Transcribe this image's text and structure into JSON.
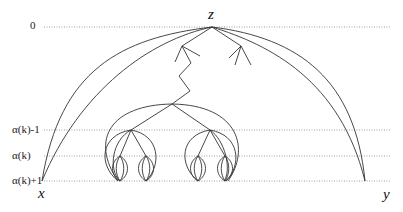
{
  "diagram": {
    "levels": [
      {
        "label": "0",
        "y": 27
      },
      {
        "label": "α(k)-1",
        "y": 130
      },
      {
        "label": "α(k)",
        "y": 156
      },
      {
        "label": "α(k)+1",
        "y": 181
      }
    ],
    "nodes": {
      "z": "z",
      "x": "x",
      "y": "y"
    },
    "colors": {
      "line": "#333333",
      "dotted": "#888888"
    }
  }
}
